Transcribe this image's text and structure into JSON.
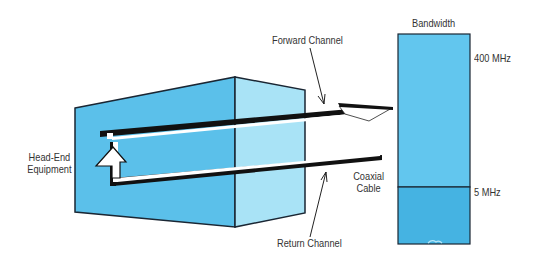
{
  "labels": {
    "head_end_line1": "Head-End",
    "head_end_line2": "Equipment",
    "forward_channel": "Forward Channel",
    "return_channel": "Return Channel",
    "coaxial_line1": "Coaxial",
    "coaxial_line2": "Cable",
    "bandwidth_title": "Bandwidth",
    "bandwidth_top": "400 MHz",
    "bandwidth_split": "5 MHz"
  },
  "colors": {
    "front_face": "#5bc0ea",
    "side_face": "#a9e3f6",
    "bandwidth_upper": "#62c6ee",
    "bandwidth_lower": "#45b3e2",
    "outline": "#1a2633",
    "cable": "#111111"
  }
}
